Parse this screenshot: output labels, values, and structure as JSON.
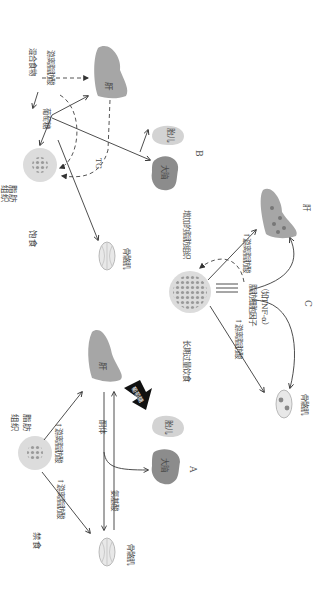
{
  "figure": {
    "orientation": "rotated 90 degrees clockwise",
    "panels": [
      {
        "id": "A",
        "label": "A",
        "state": "禁食",
        "nodes": {
          "adipose": "脂肪\n组织",
          "liver": "肝",
          "muscle": "骨骼肌",
          "brain": "大脑",
          "fetus": "胎儿"
        },
        "edges": {
          "ffa_to_liver": "↑游离脂肪酸",
          "ffa_to_muscle": "↑游离脂肪酸",
          "ketones": "酮体",
          "amino_acids": "氨基酸",
          "big_arrow": "葡萄糖"
        }
      },
      {
        "id": "B",
        "label": "B",
        "state": "饱食",
        "nodes": {
          "adipose": "脂肪\n组织",
          "liver": "肝",
          "muscle": "骨骼肌",
          "brain": "大脑",
          "fetus": "胎儿"
        },
        "edges": {
          "mixed_food": "混合食物",
          "ffa": "游离脂肪酸",
          "glucose": "葡萄糖",
          "tg": "TG"
        }
      },
      {
        "id": "C",
        "label": "C",
        "state": "长期过量饮食",
        "nodes": {
          "adipose": "增加的脂肪组织",
          "liver": "肝",
          "muscle": "骨骼肌"
        },
        "edges": {
          "ffa_to_liver": "↑游离脂肪酸",
          "ffa_to_muscle": "↑游离脂肪酸",
          "adipokines": "脂肪细胞因子",
          "adipokines_example": "（如TNF-α）"
        }
      }
    ]
  },
  "colors": {
    "dark_organ": "#8c8c8c",
    "liver": "#a6a6a6",
    "light_organ": "#d3d3d3",
    "line": "#3a3a3a"
  }
}
